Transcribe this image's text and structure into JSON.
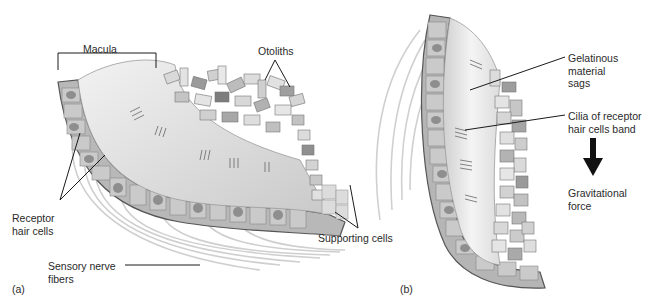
{
  "figure": {
    "panels": [
      {
        "id": "a",
        "tag": "(a)",
        "labels": {
          "macula": "Macula",
          "otoliths": "Otoliths",
          "receptor_hair_cells": "Receptor\nhair cells",
          "supporting_cells": "Supporting cells",
          "sensory_nerve_fibers": "Sensory nerve\nfibers"
        }
      },
      {
        "id": "b",
        "tag": "(b)",
        "labels": {
          "gelatinous_material": "Gelatinous\nmaterial\nsags",
          "cilia_band": "Cilia of receptor\nhair cells band",
          "gravitational_force": "Gravitational\nforce"
        }
      }
    ],
    "colors": {
      "background": "#ffffff",
      "label_text": "#2a2a2a",
      "leader_line": "#1a1a1a",
      "tissue_light": "#d6d6d6",
      "tissue_mid": "#a9a9a9",
      "tissue_dark": "#6e6e6e",
      "gel": "#e6e6e6",
      "arrow": "#111111"
    }
  }
}
